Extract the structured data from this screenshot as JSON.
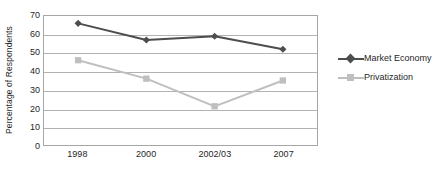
{
  "chart_data": {
    "type": "line",
    "title": "",
    "subtitle": "",
    "xlabel": "",
    "ylabel": "Percentage of Respondents",
    "categories": [
      "1998",
      "2000",
      "2002/03",
      "2007"
    ],
    "ylim": [
      0,
      70
    ],
    "yticks": [
      0,
      10,
      20,
      30,
      40,
      50,
      60,
      70
    ],
    "ytick_labels": [
      "0",
      "10",
      "20",
      "30",
      "40",
      "50",
      "60",
      "70"
    ],
    "grid": true,
    "grid_axis": "y",
    "legend_position": "right",
    "series": [
      {
        "name": "Market Economy",
        "values": [
          66,
          57,
          59,
          52
        ],
        "color": "#4d4d4d",
        "marker": "diamond"
      },
      {
        "name": "Privatization",
        "values": [
          46,
          36,
          21,
          35
        ],
        "color": "#bfbfbf",
        "marker": "square"
      }
    ]
  },
  "legend": {
    "items": [
      {
        "label": "Market Economy"
      },
      {
        "label": "Privatization"
      }
    ]
  },
  "colors": {
    "market_economy": "#4d4d4d",
    "privatization": "#bfbfbf",
    "gridline": "#b2b2b2",
    "frame": "#a6a6a6",
    "text": "#1f1f1f",
    "background": "#ffffff"
  }
}
